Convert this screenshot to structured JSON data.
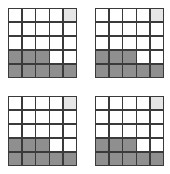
{
  "figure": {
    "grids": [
      {
        "id": "top-left",
        "rows": 5,
        "cols": 5,
        "cells": [
          [
            "empty",
            "empty",
            "empty",
            "empty",
            "light"
          ],
          [
            "empty",
            "empty",
            "empty",
            "empty",
            "empty"
          ],
          [
            "empty",
            "empty",
            "empty",
            "empty",
            "empty"
          ],
          [
            "dark",
            "dark",
            "dark",
            "empty",
            "empty"
          ],
          [
            "dark",
            "dark",
            "dark",
            "dark",
            "dark"
          ]
        ]
      },
      {
        "id": "top-right",
        "rows": 5,
        "cols": 5,
        "cells": [
          [
            "empty",
            "empty",
            "empty",
            "empty",
            "light"
          ],
          [
            "empty",
            "empty",
            "empty",
            "empty",
            "empty"
          ],
          [
            "empty",
            "empty",
            "empty",
            "empty",
            "empty"
          ],
          [
            "dark",
            "dark",
            "dark",
            "empty",
            "empty"
          ],
          [
            "dark",
            "dark",
            "dark",
            "dark",
            "dark"
          ]
        ]
      },
      {
        "id": "bottom-left",
        "rows": 5,
        "cols": 5,
        "cells": [
          [
            "empty",
            "empty",
            "empty",
            "empty",
            "light"
          ],
          [
            "empty",
            "empty",
            "empty",
            "empty",
            "empty"
          ],
          [
            "empty",
            "empty",
            "empty",
            "empty",
            "empty"
          ],
          [
            "dark",
            "dark",
            "dark",
            "empty",
            "empty"
          ],
          [
            "dark",
            "dark",
            "dark",
            "dark",
            "dark"
          ]
        ]
      },
      {
        "id": "bottom-right",
        "rows": 5,
        "cols": 5,
        "cells": [
          [
            "empty",
            "empty",
            "empty",
            "empty",
            "light"
          ],
          [
            "empty",
            "empty",
            "empty",
            "empty",
            "empty"
          ],
          [
            "empty",
            "empty",
            "empty",
            "empty",
            "empty"
          ],
          [
            "dark",
            "dark",
            "dark",
            "empty",
            "empty"
          ],
          [
            "dark",
            "dark",
            "dark",
            "dark",
            "dark"
          ]
        ]
      }
    ],
    "colors": {
      "line": "#3a3a3a",
      "dark": "#8f8f8f",
      "light": "#e6e6e6",
      "empty": "#ffffff"
    }
  }
}
